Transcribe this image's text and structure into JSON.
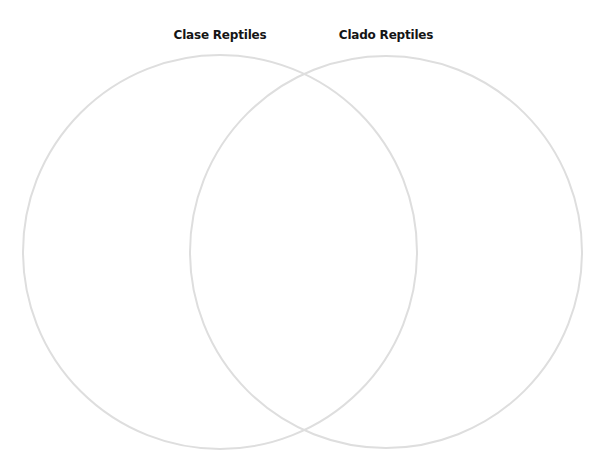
{
  "diagram": {
    "type": "venn",
    "sets": [
      {
        "label": "Clase Reptiles",
        "cx": 220,
        "cy": 252,
        "r": 197,
        "stroke": "#dedede"
      },
      {
        "label": "Clado Reptiles",
        "cx": 386,
        "cy": 252,
        "r": 196,
        "stroke": "#dedede"
      }
    ],
    "label_color": "#151515",
    "background": "#ffffff"
  }
}
